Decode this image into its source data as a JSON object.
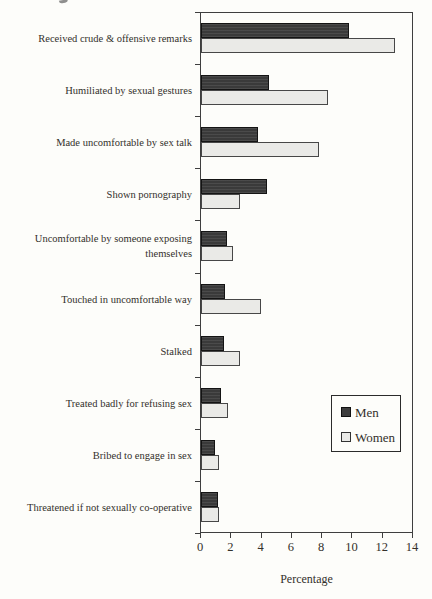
{
  "chart_data": {
    "type": "bar",
    "orientation": "horizontal",
    "title": "",
    "categories": [
      "Received crude & offensive remarks",
      "Humiliated by sexual gestures",
      "Made uncomfortable by sex talk",
      "Shown pornography",
      "Uncomfortable by someone exposing\nthemselves",
      "Touched in uncomfortable way",
      "Stalked",
      "Treated badly for refusing sex",
      "Bribed to engage in sex",
      "Threatened if not sexually co-operative"
    ],
    "series": [
      {
        "name": "Men",
        "color": "#3d3d3d",
        "values": [
          9.8,
          4.5,
          3.8,
          4.4,
          1.7,
          1.6,
          1.5,
          1.3,
          0.9,
          1.1
        ]
      },
      {
        "name": "Women",
        "color": "#eaeae7",
        "values": [
          12.9,
          8.4,
          7.8,
          2.6,
          2.1,
          4.0,
          2.6,
          1.8,
          1.2,
          1.2
        ]
      }
    ],
    "xlabel": "Percentage",
    "xlim": [
      0,
      14
    ],
    "xticks": [
      "0",
      "2",
      "4",
      "6",
      "8",
      "10",
      "12",
      "14"
    ],
    "grid": false,
    "legend_position": "inside-right"
  },
  "colors": {
    "men_fill": "#3d3d3d",
    "men_border": "#141414",
    "women_fill": "#eaeae7",
    "women_border": "#474747",
    "axis": "#3e3e3e",
    "text": "#33302b",
    "background": "#fdfdfa"
  }
}
